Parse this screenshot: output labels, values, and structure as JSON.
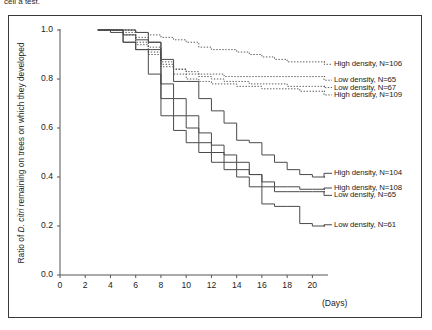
{
  "caption": {
    "clipped_text": "cell a test."
  },
  "axes": {
    "y_label_prefix": "Ratio of ",
    "y_label_italic": "D. citri",
    "y_label_suffix": " remaining on trees on which they developed",
    "y_ticks": [
      "1.0",
      "0.8",
      "0.6",
      "0.4",
      "0.2",
      "0.0"
    ],
    "x_ticks": [
      "0",
      "2",
      "4",
      "6",
      "8",
      "10",
      "12",
      "14",
      "16",
      "18",
      "20"
    ],
    "x_title": "(Days)"
  },
  "labels": {
    "hd106": "High density, N=106",
    "ld65a": "Low density, N=65",
    "ld67": "Low density, N=67",
    "hd109": "High density, N=109",
    "hd104": "High density, N=104",
    "hd108": "High density, N=108",
    "ld65b": "Low density, N=65",
    "ld61": "Low density, N=61"
  },
  "colors": {
    "line": "#4a4a4a",
    "axis": "#555555",
    "frame": "#3a3a3a",
    "text": "#1d1d1d"
  },
  "chart_data": {
    "type": "line",
    "subtype": "kaplan-meier-step",
    "title": "",
    "xlabel": "(Days)",
    "ylabel": "Ratio of D. citri remaining on trees on which they developed",
    "xlim": [
      0,
      21
    ],
    "ylim": [
      0.0,
      1.0
    ],
    "grid": false,
    "legend_position": "right-inline",
    "series": [
      {
        "name": "High density, N=106",
        "style": "dotted",
        "label_y": 0.86,
        "x": [
          3,
          5,
          6,
          7,
          8,
          9,
          10,
          11,
          12,
          14,
          15,
          16,
          17,
          18,
          19,
          20,
          21
        ],
        "y": [
          1.0,
          1.0,
          0.99,
          0.98,
          0.97,
          0.96,
          0.95,
          0.93,
          0.92,
          0.91,
          0.9,
          0.89,
          0.88,
          0.87,
          0.87,
          0.87,
          0.87
        ]
      },
      {
        "name": "Low density, N=65",
        "style": "dotted",
        "label_y": 0.795,
        "x": [
          3,
          5,
          6,
          7,
          8,
          9,
          10,
          11,
          12,
          13,
          14,
          15,
          16,
          17,
          18,
          19,
          20,
          21
        ],
        "y": [
          1.0,
          0.98,
          0.94,
          0.91,
          0.86,
          0.84,
          0.83,
          0.82,
          0.82,
          0.81,
          0.81,
          0.81,
          0.81,
          0.81,
          0.81,
          0.81,
          0.81,
          0.81
        ]
      },
      {
        "name": "Low density, N=67",
        "style": "dotted",
        "label_y": 0.765,
        "x": [
          3,
          5,
          6,
          7,
          8,
          9,
          10,
          11,
          12,
          13,
          14,
          15,
          16,
          17,
          18,
          19,
          20,
          21
        ],
        "y": [
          1.0,
          1.0,
          0.97,
          0.93,
          0.87,
          0.84,
          0.82,
          0.81,
          0.8,
          0.79,
          0.79,
          0.78,
          0.78,
          0.78,
          0.77,
          0.77,
          0.77,
          0.77
        ]
      },
      {
        "name": "High density, N=109",
        "style": "dotted",
        "label_y": 0.735,
        "x": [
          3,
          5,
          6,
          7,
          8,
          9,
          10,
          11,
          12,
          13,
          14,
          15,
          16,
          17,
          18,
          19,
          20,
          21
        ],
        "y": [
          1.0,
          0.99,
          0.95,
          0.9,
          0.85,
          0.82,
          0.8,
          0.79,
          0.78,
          0.78,
          0.77,
          0.77,
          0.76,
          0.76,
          0.76,
          0.75,
          0.75,
          0.75
        ]
      },
      {
        "name": "High density, N=104",
        "style": "solid",
        "label_y": 0.415,
        "x": [
          3,
          4,
          5,
          6,
          7,
          8,
          9,
          10,
          11,
          12,
          13,
          14,
          15,
          16,
          17,
          18,
          19,
          20,
          21
        ],
        "y": [
          1.0,
          1.0,
          1.0,
          0.99,
          0.95,
          0.88,
          0.79,
          0.79,
          0.72,
          0.67,
          0.62,
          0.55,
          0.54,
          0.49,
          0.46,
          0.43,
          0.41,
          0.4,
          0.4
        ]
      },
      {
        "name": "High density, N=108",
        "style": "solid",
        "label_y": 0.355,
        "x": [
          3,
          4,
          5,
          6,
          7,
          8,
          9,
          10,
          11,
          12,
          13,
          14,
          15,
          16,
          17,
          18,
          19,
          20,
          21
        ],
        "y": [
          1.0,
          1.0,
          0.98,
          0.96,
          0.95,
          0.78,
          0.72,
          0.65,
          0.58,
          0.53,
          0.49,
          0.46,
          0.41,
          0.38,
          0.36,
          0.36,
          0.35,
          0.35,
          0.35
        ]
      },
      {
        "name": "Low density, N=65",
        "style": "solid",
        "label_y": 0.325,
        "x": [
          3,
          4,
          5,
          6,
          7,
          8,
          9,
          10,
          11,
          12,
          13,
          14,
          15,
          16,
          17,
          18,
          19,
          20,
          21
        ],
        "y": [
          1.0,
          1.0,
          0.95,
          0.92,
          0.92,
          0.72,
          0.65,
          0.6,
          0.54,
          0.5,
          0.46,
          0.43,
          0.41,
          0.36,
          0.34,
          0.34,
          0.34,
          0.34,
          0.34
        ]
      },
      {
        "name": "Low density, N=61",
        "style": "solid",
        "label_y": 0.205,
        "x": [
          3,
          4,
          5,
          6,
          7,
          8,
          9,
          10,
          11,
          12,
          13,
          14,
          15,
          16,
          17,
          18,
          19,
          20,
          21
        ],
        "y": [
          1.0,
          0.99,
          0.95,
          0.92,
          0.82,
          0.65,
          0.59,
          0.54,
          0.5,
          0.46,
          0.43,
          0.4,
          0.36,
          0.29,
          0.28,
          0.28,
          0.21,
          0.2,
          0.2
        ]
      }
    ]
  }
}
